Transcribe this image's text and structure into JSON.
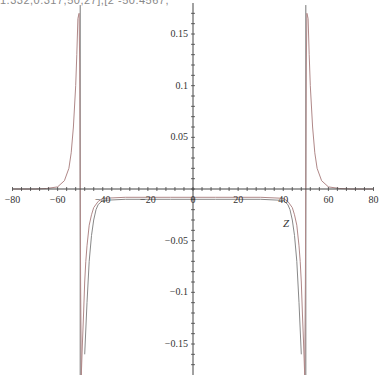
{
  "header": {
    "text": "1.332,0.317,50,27],[2 -50.4567,"
  },
  "chart_data": {
    "type": "line",
    "title": "",
    "xlabel": "Z",
    "ylabel": "",
    "xlim": [
      -80,
      80
    ],
    "ylim": [
      -0.18,
      0.18
    ],
    "grid": false,
    "legend": null,
    "x_ticks": [
      -80,
      -60,
      -40,
      -20,
      0,
      20,
      40,
      60,
      80
    ],
    "x_tick_labels": [
      "-80",
      "-60",
      "-40",
      "-20",
      "0",
      "20",
      "40",
      "60",
      "80"
    ],
    "y_ticks": [
      -0.15,
      -0.1,
      -0.05,
      0.05,
      0.1,
      0.15
    ],
    "y_tick_labels": [
      "-0.15",
      "-0.1",
      "-0.05",
      "0.05",
      "0.1",
      "0.15"
    ],
    "vertical_lines": [
      -50,
      50
    ],
    "series": [
      {
        "name": "curve-1",
        "color": "#b08888",
        "x": [
          -80,
          -70,
          -65,
          -60,
          -57,
          -55,
          -54,
          -53,
          -52,
          -51.5,
          -51,
          -50.5,
          -50.2,
          -50,
          -49.8,
          -49.5,
          -49,
          -48.5,
          -48,
          -47.5,
          -47,
          -46,
          -45,
          -44,
          -42,
          -40,
          -30,
          -20,
          -10,
          0,
          10,
          20,
          30,
          40,
          42,
          44,
          45,
          46,
          47,
          47.5,
          48,
          48.5,
          49,
          49.5,
          49.8,
          50,
          50.2,
          50.5,
          51,
          51.5,
          52,
          53,
          54,
          55,
          57,
          60,
          65,
          70,
          80
        ],
        "y": [
          0,
          0,
          0.0005,
          0.002,
          0.008,
          0.02,
          0.035,
          0.06,
          0.1,
          0.13,
          0.165,
          0.17,
          0.12,
          0,
          -0.09,
          -0.18,
          -0.15,
          -0.12,
          -0.09,
          -0.07,
          -0.055,
          -0.035,
          -0.025,
          -0.018,
          -0.012,
          -0.009,
          -0.008,
          -0.008,
          -0.008,
          -0.008,
          -0.008,
          -0.008,
          -0.008,
          -0.009,
          -0.012,
          -0.018,
          -0.025,
          -0.035,
          -0.055,
          -0.07,
          -0.09,
          -0.12,
          -0.15,
          -0.18,
          -0.09,
          0,
          0.12,
          0.17,
          0.165,
          0.13,
          0.1,
          0.06,
          0.035,
          0.02,
          0.008,
          0.002,
          0.0005,
          0,
          0
        ]
      },
      {
        "name": "curve-2",
        "color": "#888888",
        "x": [
          -48,
          -47,
          -46,
          -45,
          -44,
          -43,
          -42,
          -40,
          -30,
          -20,
          -10,
          0,
          10,
          20,
          30,
          40,
          42,
          43,
          44,
          45,
          46,
          47,
          48
        ],
        "y": [
          -0.16,
          -0.11,
          -0.07,
          -0.045,
          -0.03,
          -0.02,
          -0.015,
          -0.011,
          -0.01,
          -0.01,
          -0.01,
          -0.01,
          -0.01,
          -0.01,
          -0.01,
          -0.011,
          -0.015,
          -0.02,
          -0.03,
          -0.045,
          -0.07,
          -0.11,
          -0.16
        ]
      }
    ]
  }
}
